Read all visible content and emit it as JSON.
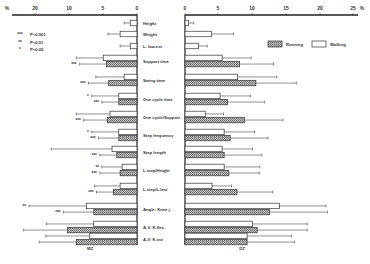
{
  "chart_data": {
    "type": "bar",
    "orientation": "horizontal",
    "layout": "back-to-back (butterfly)",
    "panels": [
      {
        "name": "MZ",
        "side": "left",
        "axis_ticks": [
          "%",
          "20",
          "10",
          "5",
          "0"
        ]
      },
      {
        "name": "DZ",
        "side": "right",
        "axis_ticks": [
          "0",
          "5",
          "10",
          "15",
          "20",
          "25",
          "%"
        ]
      }
    ],
    "legend": {
      "items": [
        {
          "name": "Running",
          "fill": "hatched"
        },
        {
          "name": "Walking",
          "fill": "white"
        }
      ],
      "position": "top-right"
    },
    "significance_legend": [
      {
        "mark": "***",
        "label": "P<0.001"
      },
      {
        "mark": "**",
        "label": "P<0.01"
      },
      {
        "mark": "*",
        "label": "P<0.05"
      }
    ],
    "categories": [
      "Height",
      "Weight",
      "L. low.ext",
      "Support time",
      "Swing time",
      "One cycle time",
      "One cycle/Support",
      "Step frequency",
      "Step length",
      "L.step/Height",
      "L.step/L.lext",
      "Angle: Knee j.",
      "A-V: K.flex.",
      "A-V: K.ext"
    ],
    "series": [
      {
        "name": "Walking",
        "MZ": {
          "values": [
            1.0,
            2.5,
            1.0,
            5.0,
            1.9,
            2.7,
            4.0,
            2.7,
            3.7,
            2.2,
            2.5,
            7.5,
            6.4,
            7.0
          ],
          "errors": [
            0.9,
            1.8,
            1.5,
            4.0,
            4.2,
            4.0,
            5.0,
            4.0,
            9.0,
            3.0,
            3.8,
            8.5,
            7.0,
            6.5
          ],
          "significance": [
            "",
            "",
            "",
            "",
            "",
            "*",
            "",
            "*",
            "",
            "**",
            "",
            "**",
            "",
            ""
          ]
        },
        "DZ": {
          "values": [
            0.5,
            3.9,
            2.0,
            5.5,
            7.8,
            5.2,
            3.0,
            5.8,
            5.5,
            5.8,
            4.0,
            14.0,
            10.0,
            9.2
          ],
          "errors": [
            0.8,
            3.3,
            1.3,
            4.3,
            5.8,
            4.5,
            2.7,
            4.5,
            4.5,
            5.3,
            2.9,
            6.9,
            8.1,
            6.6
          ]
        }
      },
      {
        "name": "Running",
        "MZ": {
          "values": [
            null,
            null,
            null,
            4.5,
            4.2,
            2.7,
            4.4,
            2.7,
            3.0,
            2.5,
            3.5,
            6.4,
            10.3,
            9.0
          ],
          "errors": [
            null,
            null,
            null,
            4.0,
            3.0,
            2.5,
            3.5,
            3.0,
            2.5,
            3.0,
            2.5,
            4.5,
            6.5,
            5.5
          ],
          "significance": [
            "",
            "",
            "",
            "***",
            "***",
            "***",
            "***",
            "***",
            "***",
            "***",
            "***",
            "***",
            "",
            ""
          ]
        },
        "DZ": {
          "values": [
            null,
            null,
            null,
            8.1,
            10.5,
            6.3,
            8.8,
            6.7,
            5.8,
            6.5,
            7.7,
            12.5,
            10.7,
            9.2
          ],
          "errors": [
            null,
            null,
            null,
            5.0,
            6.0,
            5.5,
            5.7,
            5.6,
            5.6,
            4.5,
            5.3,
            8.6,
            7.4,
            7.0
          ]
        }
      }
    ],
    "xlabel": "%",
    "grid": false
  },
  "labels": {
    "left_panel": "MZ",
    "right_panel": "DZ"
  }
}
